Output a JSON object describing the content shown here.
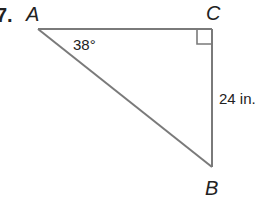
{
  "problem": {
    "number": "7.",
    "vertices": {
      "A": {
        "label": "A",
        "x": 38,
        "y": 29
      },
      "C": {
        "label": "C",
        "x": 212,
        "y": 29
      },
      "B": {
        "label": "B",
        "x": 212,
        "y": 167
      }
    },
    "angle_label": "38°",
    "side_label": "24 in.",
    "right_angle_at": "C"
  },
  "colors": {
    "line": "#7a7a7a",
    "text": "#222222"
  }
}
